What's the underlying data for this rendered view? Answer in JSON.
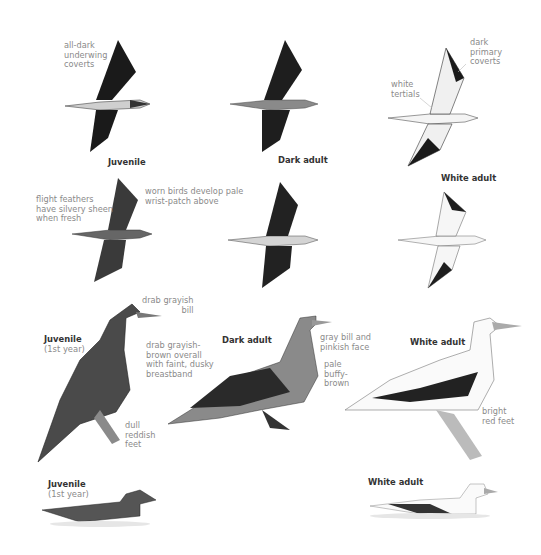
{
  "plate": {
    "subject": "Booby field guide plate",
    "flight_row_1": [
      {
        "title": "Juvenile",
        "notes": [
          "all-dark\nunderwing\ncoverts"
        ]
      },
      {
        "title": "Dark adult",
        "notes": []
      },
      {
        "title": "White adult",
        "notes": [
          "dark\nprimary\ncoverts",
          "white\ntertials"
        ]
      }
    ],
    "flight_row_2": {
      "notes": [
        "flight feathers\nhave silvery sheen\nwhen fresh",
        "worn birds develop pale\nwrist-patch above"
      ],
      "white_adult_title": "White adult"
    },
    "perched_row": [
      {
        "title": "Juvenile",
        "subtitle": "(1st year)",
        "notes": [
          "drab grayish\nbill",
          "drab grayish-\nbrown overall\nwith faint, dusky\nbreastband",
          "dull\nreddish\nfeet"
        ]
      },
      {
        "title": "Dark adult",
        "notes": [
          "gray bill and\npinkish face",
          "pale\nbuffy-\nbrown"
        ]
      },
      {
        "title": "White adult",
        "notes": [
          "bright\nred feet"
        ]
      }
    ],
    "swimming_row": [
      {
        "title": "Juvenile",
        "subtitle": "(1st year)"
      },
      {
        "title": "White adult"
      }
    ],
    "colors": {
      "dark_plumage": "#1e1e1e",
      "mid_gray": "#6b6b6b",
      "note_text": "#8a8a8a",
      "title_text": "#333333"
    }
  }
}
